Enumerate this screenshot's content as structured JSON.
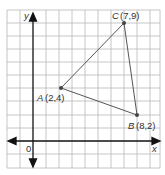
{
  "diagram": {
    "type": "coordinate-plane-triangle",
    "axes": {
      "x_label": "x",
      "y_label": "y",
      "origin_label": "0"
    },
    "points": [
      {
        "name": "A",
        "coords": "(2,4)",
        "x": 2,
        "y": 4
      },
      {
        "name": "B",
        "coords": "(8,2)",
        "x": 8,
        "y": 2
      },
      {
        "name": "C",
        "coords": "(7,9)",
        "x": 7,
        "y": 9
      }
    ],
    "colors": {
      "grid": "#b8b8b8",
      "axis": "#111111",
      "triangle": "#555555",
      "point": "#444444"
    }
  }
}
